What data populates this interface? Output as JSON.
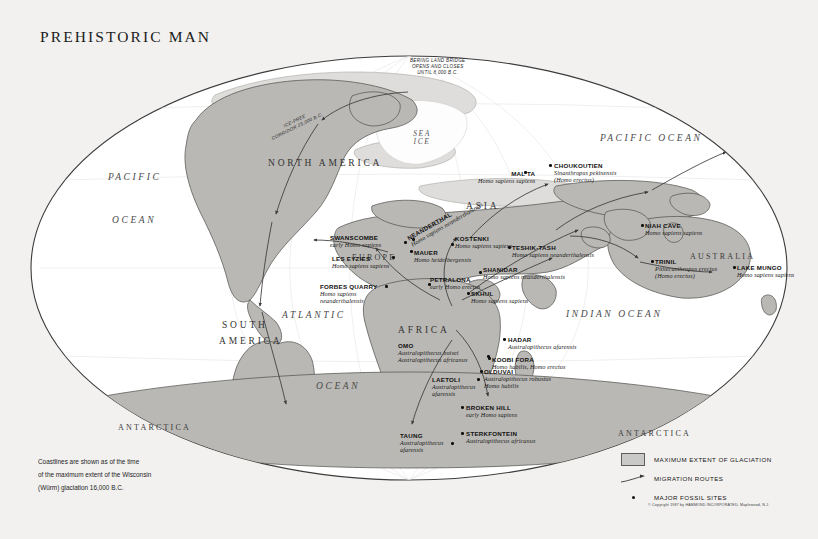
{
  "title": "PREHISTORIC MAN",
  "notes": [
    "Coastlines are shown as of the time",
    "of the maximum extent of the Wisconsin",
    "(Würm) glaciation 16,000 B.C."
  ],
  "copyright": "© Copyright 1987 by HAMMOND INCORPORATED, Maplewood, N.J.",
  "legend": {
    "items": [
      {
        "key": "glaciation-swatch",
        "label": "MAXIMUM EXTENT OF GLACIATION"
      },
      {
        "key": "migration-arrow",
        "label": "MIGRATION ROUTES"
      },
      {
        "key": "fossil-dot",
        "label": "MAJOR FOSSIL SITES"
      }
    ]
  },
  "colors": {
    "background": "#f2f1ef",
    "land": "#b9b8b4",
    "ice": "#d9d9d6",
    "ocean": "#ffffff",
    "outline": "#4a4a4a",
    "text": "#1b1b1b"
  },
  "oceans": [
    {
      "name": "PACIFIC",
      "x": 108,
      "y": 172
    },
    {
      "name": "OCEAN",
      "x": 112,
      "y": 215
    },
    {
      "name": "ATLANTIC",
      "x": 282,
      "y": 310
    },
    {
      "name": "OCEAN",
      "x": 316,
      "y": 381
    },
    {
      "name": "PACIFIC OCEAN",
      "x": 600,
      "y": 133
    },
    {
      "name": "INDIAN OCEAN",
      "x": 566,
      "y": 309
    }
  ],
  "continents": [
    {
      "name": "NORTH AMERICA",
      "x": 268,
      "y": 158,
      "size": "lg"
    },
    {
      "name": "SOUTH",
      "x": 222,
      "y": 320,
      "size": "lg"
    },
    {
      "name": "AMERICA",
      "x": 219,
      "y": 336,
      "size": "lg"
    },
    {
      "name": "EUROPE",
      "x": 352,
      "y": 254,
      "size": "sm"
    },
    {
      "name": "ASIA",
      "x": 466,
      "y": 201,
      "size": "lg"
    },
    {
      "name": "AFRICA",
      "x": 398,
      "y": 325,
      "size": "lg"
    },
    {
      "name": "AUSTRALIA",
      "x": 690,
      "y": 253,
      "size": "sm"
    },
    {
      "name": "ANTARCTICA",
      "x": 118,
      "y": 424,
      "size": "sm"
    },
    {
      "name": "ANTARCTICA",
      "x": 618,
      "y": 430,
      "size": "sm"
    }
  ],
  "sea_ice_label": "SEA\nICE",
  "annotations": [
    {
      "name": "bering-land-bridge",
      "text": "BERING LAND BRIDGE\nOPENS AND CLOSES\nUNTIL 8,000 B.C.",
      "x": 410,
      "y": 58
    },
    {
      "name": "ice-free-corridor",
      "text": "ICE-FREE\nCORRIDOR 25,000 B.C.",
      "x": 268,
      "y": 118
    }
  ],
  "fossil_sites": [
    {
      "id": "malta",
      "name": "MAL'TA",
      "species": [
        "Homo sapiens sapiens"
      ],
      "lx": 478,
      "ly": 170,
      "align": "right",
      "dx": 524,
      "dy": 171
    },
    {
      "id": "choukoutien",
      "name": "CHOUKOUTIEN",
      "species": [
        "Sinanthropus pekinensis",
        "(Homo erectus)"
      ],
      "lx": 554,
      "ly": 162,
      "align": "left",
      "dx": 549,
      "dy": 164
    },
    {
      "id": "swanscombe",
      "name": "SWANSCOMBE",
      "species": [
        "early Homo sapiens"
      ],
      "lx": 330,
      "ly": 234,
      "align": "left",
      "dx": 404,
      "dy": 241
    },
    {
      "id": "neanderthal",
      "name": "NEANDERTHAL",
      "species": [
        "Homo sapiens neanderthalensis"
      ],
      "lx": 404,
      "ly": 214,
      "align": "left",
      "dx": 412,
      "dy": 238,
      "rotate": -30
    },
    {
      "id": "kostenki",
      "name": "KOSTENKI",
      "species": [
        "Homo sapiens sapiens"
      ],
      "lx": 455,
      "ly": 235,
      "align": "left",
      "dx": 451,
      "dy": 243
    },
    {
      "id": "les-eyzies",
      "name": "LES EYZIES",
      "species": [
        "Homo sapiens sapiens"
      ],
      "lx": 332,
      "ly": 255,
      "align": "left",
      "dx": 392,
      "dy": 256
    },
    {
      "id": "mauer",
      "name": "MAUER",
      "species": [
        "Homo heidelbergensis"
      ],
      "lx": 414,
      "ly": 249,
      "align": "left",
      "dx": 410,
      "dy": 250
    },
    {
      "id": "teshik-tash",
      "name": "TESHIK-TASH",
      "species": [
        "Homo sapiens neanderthalensis"
      ],
      "lx": 512,
      "ly": 244,
      "align": "left",
      "dx": 508,
      "dy": 246
    },
    {
      "id": "shanidar",
      "name": "SHANIDAR",
      "species": [
        "Homo sapiens neanderthalensis"
      ],
      "lx": 483,
      "ly": 266,
      "align": "left",
      "dx": 479,
      "dy": 271
    },
    {
      "id": "forbes-quarry",
      "name": "FORBES QUARRY",
      "species": [
        "Homo sapiens",
        "neanderthalensis"
      ],
      "lx": 320,
      "ly": 283,
      "align": "left",
      "dx": 385,
      "dy": 285
    },
    {
      "id": "petralona",
      "name": "PETRALONA",
      "species": [
        "early Homo erectus"
      ],
      "lx": 430,
      "ly": 276,
      "align": "left",
      "dx": 428,
      "dy": 283
    },
    {
      "id": "skhul",
      "name": "SKHUL",
      "species": [
        "Homo sapiens sapiens"
      ],
      "lx": 471,
      "ly": 290,
      "align": "left",
      "dx": 467,
      "dy": 292
    },
    {
      "id": "hadar",
      "name": "HADAR",
      "species": [
        "Australopithecus afarensis"
      ],
      "lx": 508,
      "ly": 336,
      "align": "left",
      "dx": 503,
      "dy": 338
    },
    {
      "id": "omo",
      "name": "OMO",
      "species": [
        "Australopithecus boisei",
        "Australopithecus africanus"
      ],
      "lx": 398,
      "ly": 342,
      "align": "left",
      "dx": 487,
      "dy": 355
    },
    {
      "id": "koobi-fora",
      "name": "KOOBI FORA",
      "species": [
        "Homo habilis, Homo erectus"
      ],
      "lx": 492,
      "ly": 356,
      "align": "left",
      "dx": 488,
      "dy": 357
    },
    {
      "id": "olduvai",
      "name": "OLDUVAI",
      "species": [
        "Australopithecus robustus",
        "Homo habilis"
      ],
      "lx": 484,
      "ly": 368,
      "align": "left",
      "dx": 480,
      "dy": 370
    },
    {
      "id": "laetoli",
      "name": "LAETOLI",
      "species": [
        "Australopithecus",
        "afarensis"
      ],
      "lx": 432,
      "ly": 376,
      "align": "left",
      "dx": 477,
      "dy": 378
    },
    {
      "id": "broken-hill",
      "name": "BROKEN HILL",
      "species": [
        "early Homo sapiens"
      ],
      "lx": 466,
      "ly": 404,
      "align": "left",
      "dx": 461,
      "dy": 406
    },
    {
      "id": "sterkfontein",
      "name": "STERKFONTEIN",
      "species": [
        "Australopithecus africanus"
      ],
      "lx": 466,
      "ly": 430,
      "align": "left",
      "dx": 461,
      "dy": 432
    },
    {
      "id": "taung",
      "name": "TAUNG",
      "species": [
        "Australopithecus",
        "afarensis"
      ],
      "lx": 400,
      "ly": 432,
      "align": "left",
      "dx": 451,
      "dy": 442
    },
    {
      "id": "niah-cave",
      "name": "NIAH CAVE",
      "species": [
        "Homo sapiens sapiens"
      ],
      "lx": 645,
      "ly": 222,
      "align": "left",
      "dx": 641,
      "dy": 224
    },
    {
      "id": "trinil",
      "name": "TRINIL",
      "species": [
        "Pithecanthropus erectus",
        "(Homo erectus)"
      ],
      "lx": 655,
      "ly": 258,
      "align": "left",
      "dx": 651,
      "dy": 260
    },
    {
      "id": "lake-mungo",
      "name": "LAKE MUNGO",
      "species": [
        "Homo sapiens sapiens"
      ],
      "lx": 737,
      "ly": 264,
      "align": "left",
      "dx": 733,
      "dy": 266
    }
  ]
}
